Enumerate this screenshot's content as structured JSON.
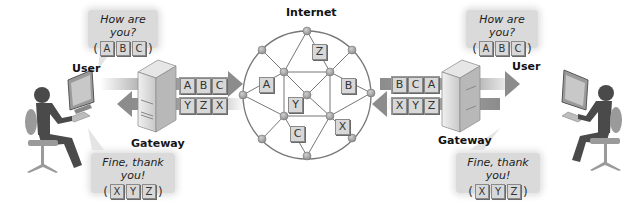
{
  "title": "Internet",
  "colors": {
    "arrow": "#9c9c9c",
    "packet_fill": "#d8d8d8",
    "packet_border": "#8a8a8a",
    "node": "#a8a8a8",
    "network_line": "#777777",
    "bubble": "#dadada",
    "person": "#4a4a4a",
    "chair": "#9a9a9a"
  },
  "left": {
    "user_label": "User",
    "gateway_label": "Gateway",
    "question": "How are you?",
    "question_packets": [
      "A",
      "B",
      "C"
    ],
    "answer": "Fine, thank you!",
    "answer_packets": [
      "X",
      "Y",
      "Z"
    ],
    "outgoing_packets": [
      "A",
      "B",
      "C"
    ],
    "incoming_packets": [
      "Y",
      "Z",
      "X"
    ]
  },
  "right": {
    "user_label": "User",
    "gateway_label": "Gateway",
    "question": "How are you?",
    "question_packets": [
      "A",
      "B",
      "C"
    ],
    "answer": "Fine, thank you!",
    "answer_packets": [
      "X",
      "Y",
      "Z"
    ],
    "incoming_packets": [
      "B",
      "C",
      "A"
    ],
    "outgoing_packets": [
      "X",
      "Y",
      "Z"
    ]
  },
  "network_packets": [
    "A",
    "Z",
    "B",
    "Y",
    "C",
    "X"
  ],
  "paren_open": "(",
  "paren_close": ")"
}
